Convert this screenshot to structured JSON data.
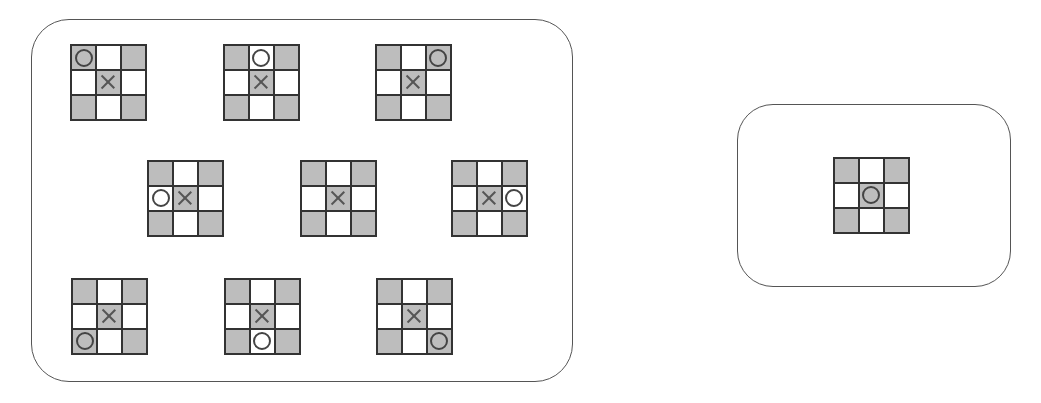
{
  "diagram": {
    "colors": {
      "shaded_cell": "#bdbdbd",
      "empty_cell": "#ffffff",
      "grid_line": "#333333",
      "box_border": "#555555",
      "mark": "#444444"
    },
    "shading_pattern": [
      "shaded",
      "empty",
      "shaded",
      "empty",
      "shaded",
      "empty",
      "shaded",
      "empty",
      "shaded"
    ],
    "left_group": {
      "boards": [
        {
          "id": "b1",
          "x": 70,
          "y": 44,
          "cells": [
            "O",
            "",
            "",
            "",
            "X",
            "",
            "",
            "",
            ""
          ]
        },
        {
          "id": "b2",
          "x": 223,
          "y": 44,
          "cells": [
            "",
            "O",
            "",
            "",
            "X",
            "",
            "",
            "",
            ""
          ]
        },
        {
          "id": "b3",
          "x": 375,
          "y": 44,
          "cells": [
            "",
            "",
            "O",
            "",
            "X",
            "",
            "",
            "",
            ""
          ]
        },
        {
          "id": "b4",
          "x": 147,
          "y": 160,
          "cells": [
            "",
            "",
            "",
            "O",
            "X",
            "",
            "",
            "",
            ""
          ]
        },
        {
          "id": "b5",
          "x": 300,
          "y": 160,
          "cells": [
            "",
            "",
            "",
            "",
            "X",
            "",
            "",
            "",
            ""
          ]
        },
        {
          "id": "b6",
          "x": 451,
          "y": 160,
          "cells": [
            "",
            "",
            "",
            "",
            "X",
            "O",
            "",
            "",
            ""
          ]
        },
        {
          "id": "b7",
          "x": 71,
          "y": 278,
          "cells": [
            "",
            "",
            "",
            "",
            "X",
            "",
            "O",
            "",
            ""
          ]
        },
        {
          "id": "b8",
          "x": 224,
          "y": 278,
          "cells": [
            "",
            "",
            "",
            "",
            "X",
            "",
            "",
            "O",
            ""
          ]
        },
        {
          "id": "b9",
          "x": 376,
          "y": 278,
          "cells": [
            "",
            "",
            "",
            "",
            "X",
            "",
            "",
            "",
            "O"
          ]
        }
      ]
    },
    "right_group": {
      "boards": [
        {
          "id": "b10",
          "x": 833,
          "y": 157,
          "cells": [
            "",
            "",
            "",
            "",
            "O",
            "",
            "",
            "",
            ""
          ]
        }
      ]
    }
  }
}
